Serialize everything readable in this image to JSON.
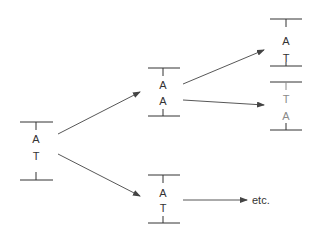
{
  "diagram": {
    "colors": {
      "primary": "#333333",
      "faded": "#8a8a8a",
      "arrow": "#444444"
    },
    "nodes": [
      {
        "id": "parent",
        "top_base": "A",
        "bottom_base": "T",
        "style": "normal"
      },
      {
        "id": "mutant",
        "top_base": "A",
        "bottom_base": "A",
        "style": "normal"
      },
      {
        "id": "normal-daughter",
        "top_base": "A",
        "bottom_base": "T",
        "style": "normal"
      },
      {
        "id": "mutant-daughter-1",
        "top_base": "A",
        "bottom_base": "T",
        "style": "normal"
      },
      {
        "id": "mutant-daughter-2",
        "top_base": "T",
        "bottom_base": "A",
        "style": "faded"
      }
    ],
    "edges": [
      {
        "from": "parent",
        "to": "mutant"
      },
      {
        "from": "parent",
        "to": "normal-daughter"
      },
      {
        "from": "mutant",
        "to": "mutant-daughter-1"
      },
      {
        "from": "mutant",
        "to": "mutant-daughter-2"
      },
      {
        "from": "normal-daughter",
        "to": "etc"
      }
    ],
    "etc_label": "etc."
  }
}
